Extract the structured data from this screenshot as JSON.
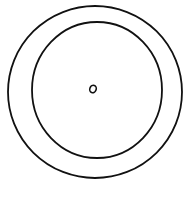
{
  "drawing": {
    "background": "#ffffff",
    "stroke_color": "#111111",
    "shapes": [
      {
        "name": "outer-ring",
        "cx": 95,
        "cy": 92,
        "rx": 87,
        "ry": 86,
        "stroke_width": 1.8
      },
      {
        "name": "inner-ring",
        "cx": 97,
        "cy": 90,
        "rx": 65,
        "ry": 68,
        "stroke_width": 1.8
      },
      {
        "name": "center-dot",
        "cx": 93,
        "cy": 89,
        "rx": 3.2,
        "ry": 3.8,
        "stroke_width": 1.6
      }
    ]
  }
}
